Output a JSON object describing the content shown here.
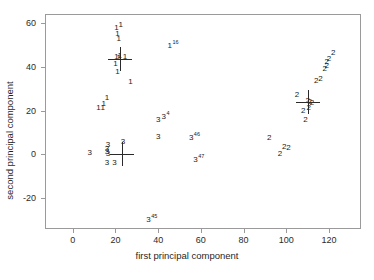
{
  "chart_data": {
    "type": "scatter",
    "title": "",
    "xlabel": "first principal component",
    "ylabel": "second principal component",
    "xlim": [
      -13,
      135
    ],
    "ylim": [
      -34,
      64
    ],
    "xticks": [
      0,
      20,
      40,
      60,
      80,
      100,
      120
    ],
    "yticks": [
      -20,
      0,
      20,
      40,
      60
    ],
    "grid": false,
    "legend": null,
    "point_marker": "class-label-text",
    "series": [
      {
        "name": "1",
        "label": "1",
        "points": [
          {
            "x": 20.5,
            "y": 57.5,
            "label": "1"
          },
          {
            "x": 22.5,
            "y": 59.0,
            "label": "1"
          },
          {
            "x": 21.0,
            "y": 55.0,
            "label": "1"
          },
          {
            "x": 21.5,
            "y": 52.5,
            "label": "1"
          },
          {
            "x": 20.5,
            "y": 44.5,
            "label": "1"
          },
          {
            "x": 21.5,
            "y": 44.0,
            "label": "1"
          },
          {
            "x": 22.0,
            "y": 45.0,
            "label": "1"
          },
          {
            "x": 24.5,
            "y": 44.5,
            "label": "1"
          },
          {
            "x": 20.0,
            "y": 41.0,
            "label": "1"
          },
          {
            "x": 21.0,
            "y": 37.5,
            "label": "1"
          },
          {
            "x": 27.0,
            "y": 33.0,
            "label": "1"
          },
          {
            "x": 16.0,
            "y": 25.5,
            "label": "1"
          },
          {
            "x": 14.5,
            "y": 23.0,
            "label": "1"
          },
          {
            "x": 12.0,
            "y": 21.0,
            "label": "1"
          },
          {
            "x": 14.0,
            "y": 21.0,
            "label": "1"
          },
          {
            "x": 47.0,
            "y": 50.0,
            "label": "1",
            "sup": "16"
          }
        ],
        "centroid": {
          "x": 22.0,
          "y": 43.5
        }
      },
      {
        "name": "2",
        "label": "2",
        "points": [
          {
            "x": 122.0,
            "y": 46.0,
            "label": "2"
          },
          {
            "x": 120.0,
            "y": 43.5,
            "label": "2"
          },
          {
            "x": 119.0,
            "y": 42.0,
            "label": "2"
          },
          {
            "x": 119.0,
            "y": 40.5,
            "label": "2"
          },
          {
            "x": 118.0,
            "y": 39.0,
            "label": "2"
          },
          {
            "x": 114.0,
            "y": 33.5,
            "label": "2"
          },
          {
            "x": 116.0,
            "y": 34.5,
            "label": "2"
          },
          {
            "x": 105.0,
            "y": 27.0,
            "label": "2"
          },
          {
            "x": 110.0,
            "y": 24.5,
            "label": "2"
          },
          {
            "x": 111.0,
            "y": 24.0,
            "label": "2"
          },
          {
            "x": 112.0,
            "y": 23.5,
            "label": "2"
          },
          {
            "x": 110.5,
            "y": 21.0,
            "label": "2"
          },
          {
            "x": 108.0,
            "y": 20.0,
            "label": "2"
          },
          {
            "x": 109.0,
            "y": 15.5,
            "label": "2"
          },
          {
            "x": 92.0,
            "y": 7.5,
            "label": "2"
          },
          {
            "x": 99.0,
            "y": 3.5,
            "label": "2"
          },
          {
            "x": 101.0,
            "y": 3.0,
            "label": "2"
          },
          {
            "x": 97.0,
            "y": 0.0,
            "label": "2"
          }
        ],
        "centroid": {
          "x": 110.0,
          "y": 24.0
        }
      },
      {
        "name": "3",
        "label": "3",
        "points": [
          {
            "x": 40.0,
            "y": 15.5,
            "label": "3"
          },
          {
            "x": 43.5,
            "y": 17.5,
            "label": "3",
            "sup": "4"
          },
          {
            "x": 40.0,
            "y": 8.0,
            "label": "3"
          },
          {
            "x": 57.0,
            "y": 8.0,
            "label": "3",
            "sup": "46"
          },
          {
            "x": 23.5,
            "y": 5.5,
            "label": "3"
          },
          {
            "x": 16.5,
            "y": 4.5,
            "label": "3"
          },
          {
            "x": 16.0,
            "y": 2.5,
            "label": "3"
          },
          {
            "x": 16.0,
            "y": 1.0,
            "label": "3"
          },
          {
            "x": 16.5,
            "y": 0.0,
            "label": "3"
          },
          {
            "x": 8.0,
            "y": 0.5,
            "label": "3"
          },
          {
            "x": 16.0,
            "y": -4.0,
            "label": "3"
          },
          {
            "x": 19.5,
            "y": -4.0,
            "label": "3"
          },
          {
            "x": 59.0,
            "y": -2.0,
            "label": "3",
            "sup": "47"
          },
          {
            "x": 37.0,
            "y": -29.5,
            "label": "3",
            "sup": "45"
          }
        ],
        "centroid": {
          "x": 23.0,
          "y": 0.0
        }
      }
    ]
  },
  "axes": {
    "x_tick_labels": [
      "0",
      "20",
      "40",
      "60",
      "80",
      "100",
      "120"
    ],
    "y_tick_labels": [
      "-20",
      "0",
      "20",
      "40",
      "60"
    ],
    "x_axis_title": "first principal component",
    "y_axis_title": "second principal component"
  },
  "colors": {
    "frame": "#9a9a9a",
    "text": "#1a1a1a",
    "centroid": "#2a2a2a",
    "background": "#ffffff"
  }
}
